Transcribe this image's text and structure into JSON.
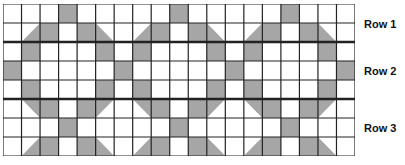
{
  "diagram": {
    "columns": 19,
    "rows": 8,
    "cell_size": 18.5,
    "shade_color": "#a6a6a6",
    "line_color": "#222222",
    "thick_lines_after_rows": [
      2,
      5
    ],
    "period": 6,
    "pattern_rows": [
      [
        "",
        "",
        "",
        "F",
        "",
        ""
      ],
      [
        "",
        "BR",
        "F",
        "",
        "F",
        "BL"
      ],
      [
        "",
        "F",
        "",
        "",
        "",
        "F"
      ],
      [
        "F",
        "",
        "",
        "",
        "",
        ""
      ],
      [
        "",
        "F",
        "",
        "",
        "",
        "F"
      ],
      [
        "",
        "TR",
        "F",
        "",
        "F",
        "TL"
      ],
      [
        "",
        "",
        "",
        "F",
        "",
        ""
      ],
      [
        "",
        "BR",
        "F",
        "",
        "F",
        "BL"
      ]
    ],
    "legend": "F=full shaded, BR=lower-right triangle, BL=lower-left triangle, TR=upper-right triangle, TL=upper-left triangle"
  },
  "labels": [
    {
      "text": "Row 1",
      "y": 18
    },
    {
      "text": "Row 2",
      "y": 65
    },
    {
      "text": "Row 3",
      "y": 122
    }
  ]
}
